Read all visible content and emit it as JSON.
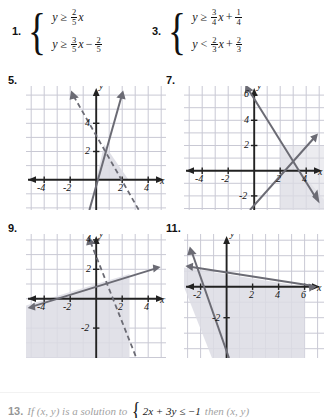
{
  "page": {
    "width": 320,
    "height": 418,
    "background": "#ffffff",
    "grid_color": "#c9c9d4",
    "axis_color": "#222222",
    "line_color": "#6b6b74",
    "shade_color": "#dcdce4"
  },
  "systems": [
    {
      "number": "1.",
      "inequalities": [
        {
          "lhs": "y",
          "op": "≥",
          "coef": {
            "num": "2",
            "den": "5"
          },
          "var": "x",
          "const": null,
          "sign": null
        },
        {
          "lhs": "y",
          "op": "≥",
          "coef": {
            "num": "3",
            "den": "5"
          },
          "var": "x",
          "const": {
            "num": "2",
            "den": "5"
          },
          "sign": "−"
        }
      ]
    },
    {
      "number": "3.",
      "inequalities": [
        {
          "lhs": "y",
          "op": "≥",
          "coef": {
            "num": "3",
            "den": "4"
          },
          "var": "x",
          "const": {
            "num": "1",
            "den": "4"
          },
          "sign": "+"
        },
        {
          "lhs": "y",
          "op": "<",
          "coef": {
            "num": "2",
            "den": "3"
          },
          "var": "x",
          "const": {
            "num": "2",
            "den": "3"
          },
          "sign": "+"
        }
      ]
    }
  ],
  "graphs": [
    {
      "number": "5.",
      "x_axis_label": "x",
      "y_axis_label": "y",
      "x_ticks": [
        "-4",
        "-2",
        "2",
        "4"
      ],
      "y_ticks": [
        "4",
        "2"
      ],
      "x_range": [
        -5.4,
        5.4
      ],
      "y_range": [
        -2.2,
        6.6
      ],
      "lines": [
        {
          "style": "solid",
          "slope": 3.0,
          "intercept": -0.6,
          "arrows": "up-right"
        },
        {
          "style": "dashed",
          "slope": -2.0,
          "intercept": 5.4,
          "arrows": "both"
        }
      ],
      "shaded": "region between lines in quadrant I above x-axis"
    },
    {
      "number": "7.",
      "x_axis_label": "x",
      "y_axis_label": "y",
      "x_ticks": [
        "-4",
        "-2",
        "2",
        "4"
      ],
      "y_ticks": [
        "6",
        "4",
        "2",
        "-2"
      ],
      "x_range": [
        -5.4,
        5.4
      ],
      "y_range": [
        -2.6,
        7.2
      ],
      "lines": [
        {
          "style": "solid",
          "slope": -1.0,
          "intercept": 6.0,
          "arrows": "both"
        },
        {
          "style": "solid",
          "slope": 1.0,
          "intercept": -2.0,
          "arrows": "up-right"
        }
      ],
      "shaded": "wedge right of intersection below upper line and right of lower line"
    },
    {
      "number": "9.",
      "x_axis_label": "x",
      "y_axis_label": "y",
      "x_ticks": [
        "-4",
        "-2",
        "2",
        "4"
      ],
      "y_ticks": [
        "4",
        "2",
        "-2"
      ],
      "x_range": [
        -5.4,
        5.4
      ],
      "y_range": [
        -3.0,
        5.4
      ],
      "lines": [
        {
          "style": "solid",
          "slope": 0.4,
          "intercept": 1.0,
          "arrows": "both"
        },
        {
          "style": "dashed",
          "slope": -2.5,
          "intercept": 5.0,
          "arrows": "both"
        }
      ],
      "shaded": "region below the solid line and left of the dashed line"
    },
    {
      "number": "11.",
      "x_axis_label": "x",
      "y_axis_label": "y",
      "x_ticks": [
        "-2",
        "2",
        "4",
        "6"
      ],
      "y_ticks": [
        "-2"
      ],
      "x_range": [
        -3.2,
        7.8
      ],
      "y_range": [
        -4.6,
        3.4
      ],
      "lines": [
        {
          "style": "solid",
          "slope": -0.33,
          "intercept": 2.3,
          "arrows": "both"
        },
        {
          "style": "solid",
          "slope": -2.6,
          "intercept": -3.9,
          "arrows": "both"
        }
      ],
      "shaded": "region below the shallow line and right of the steep line"
    }
  ],
  "bottom_problem": {
    "number": "13.",
    "text_before": "If (x, y) is a solution to",
    "inequality": "2x + 3y ≤ −1",
    "text_after": "then (x, y)"
  }
}
